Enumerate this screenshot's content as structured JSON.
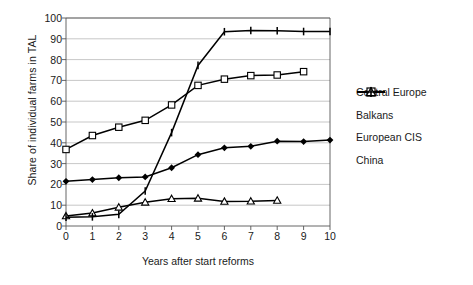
{
  "chart_data": {
    "type": "line",
    "title": "",
    "xlabel": "Years after start reforms",
    "ylabel": "Share of individual farms in TAL",
    "x": [
      0,
      1,
      2,
      3,
      4,
      5,
      6,
      7,
      8,
      9,
      10
    ],
    "xlim": [
      0,
      10
    ],
    "ylim": [
      0,
      100
    ],
    "ytick_labels": [
      "0",
      "10",
      "20",
      "30",
      "40",
      "50",
      "60",
      "70",
      "80",
      "90",
      "100"
    ],
    "xtick_labels": [
      "0",
      "1",
      "2",
      "3",
      "4",
      "5",
      "6",
      "7",
      "8",
      "9",
      "10"
    ],
    "grid": "horizontal",
    "legend_position": "right",
    "series": [
      {
        "name": "Central Europe",
        "marker": "filled-diamond",
        "color": "#000000",
        "x": [
          0,
          1,
          2,
          3,
          4,
          5,
          6,
          7,
          8,
          9,
          10
        ],
        "values": [
          21.5,
          22.3,
          23.2,
          23.6,
          28.0,
          34.3,
          37.6,
          38.3,
          40.8,
          40.6,
          41.3
        ]
      },
      {
        "name": "Balkans",
        "marker": "open-square",
        "color": "#000000",
        "x": [
          0,
          1,
          2,
          3,
          4,
          5,
          6,
          7,
          8,
          9
        ],
        "values": [
          36.8,
          43.5,
          47.5,
          50.8,
          58.2,
          67.6,
          70.6,
          72.3,
          72.6,
          74.2
        ]
      },
      {
        "name": "European CIS",
        "marker": "open-triangle",
        "color": "#000000",
        "x": [
          0,
          1,
          2,
          3,
          4,
          5,
          6,
          7,
          8
        ],
        "values": [
          4.8,
          6.2,
          9.0,
          11.4,
          13.1,
          13.3,
          11.8,
          11.9,
          12.3
        ]
      },
      {
        "name": "China",
        "marker": "plus",
        "color": "#000000",
        "x": [
          0,
          1,
          2,
          3,
          4,
          5,
          6,
          7,
          8,
          9,
          10
        ],
        "values": [
          4.2,
          4.4,
          5.6,
          16.8,
          44.9,
          77.2,
          93.4,
          94.0,
          93.9,
          93.5,
          93.5
        ]
      }
    ]
  },
  "axes": {
    "ylabel": "Share of individual farms in TAL",
    "xlabel": "Years after start reforms"
  },
  "legend": {
    "items": [
      {
        "label": "Central Europe"
      },
      {
        "label": "Balkans"
      },
      {
        "label": "European CIS"
      },
      {
        "label": "China"
      }
    ]
  }
}
